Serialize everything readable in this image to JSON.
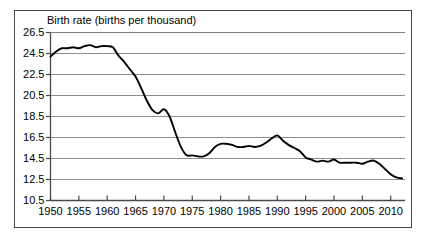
{
  "chart_data": {
    "type": "line",
    "title": "Birth rate (births per thousand)",
    "xlabel": "",
    "ylabel": "",
    "ylim": [
      10.5,
      26.5
    ],
    "xlim": [
      1950,
      2012
    ],
    "yticks": [
      10.5,
      12.5,
      14.5,
      16.5,
      18.5,
      20.5,
      22.5,
      24.5,
      26.5
    ],
    "ytick_labels": [
      "10.5",
      "12.5",
      "14.5",
      "16.5",
      "18.5",
      "20.5",
      "22.5",
      "24.5",
      "26.5"
    ],
    "xticks": [
      1950,
      1955,
      1960,
      1965,
      1970,
      1975,
      1980,
      1985,
      1990,
      1995,
      2000,
      2005,
      2010
    ],
    "xtick_labels": [
      "1950",
      "1955",
      "1960",
      "1965",
      "1970",
      "1975",
      "1980",
      "1985",
      "1990",
      "1995",
      "2000",
      "2005",
      "2010"
    ],
    "grid": true,
    "grid_axis": "y",
    "legend": false,
    "line_color": "#000000",
    "grid_color": "#808080",
    "axis_color": "#4a4a4a",
    "series": [
      {
        "name": "Birth rate",
        "x": [
          1950,
          1951,
          1952,
          1953,
          1954,
          1955,
          1956,
          1957,
          1958,
          1959,
          1960,
          1961,
          1962,
          1963,
          1964,
          1965,
          1966,
          1967,
          1968,
          1969,
          1970,
          1971,
          1972,
          1973,
          1974,
          1975,
          1976,
          1977,
          1978,
          1979,
          1980,
          1981,
          1982,
          1983,
          1984,
          1985,
          1986,
          1987,
          1988,
          1989,
          1990,
          1991,
          1992,
          1993,
          1994,
          1995,
          1996,
          1997,
          1998,
          1999,
          2000,
          2001,
          2002,
          2003,
          2004,
          2005,
          2006,
          2007,
          2008,
          2009,
          2010,
          2011,
          2012
        ],
        "values": [
          24.2,
          24.7,
          25.0,
          25.0,
          25.1,
          25.0,
          25.2,
          25.3,
          25.1,
          25.2,
          25.2,
          25.1,
          24.3,
          23.7,
          23.0,
          22.3,
          21.2,
          20.0,
          19.1,
          18.8,
          19.2,
          18.5,
          17.0,
          15.6,
          14.8,
          14.8,
          14.7,
          14.7,
          15.0,
          15.6,
          15.9,
          15.9,
          15.8,
          15.6,
          15.6,
          15.7,
          15.6,
          15.7,
          16.0,
          16.4,
          16.7,
          16.2,
          15.8,
          15.5,
          15.2,
          14.6,
          14.4,
          14.2,
          14.3,
          14.2,
          14.4,
          14.1,
          14.1,
          14.1,
          14.1,
          14.0,
          14.2,
          14.3,
          14.0,
          13.5,
          13.0,
          12.7,
          12.6
        ]
      }
    ]
  }
}
